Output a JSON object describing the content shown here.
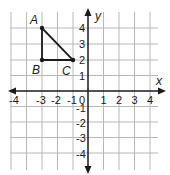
{
  "figure": {
    "type": "coordinate-plane",
    "x_axis_label": "x",
    "y_axis_label": "y",
    "x_ticks": [
      "-4",
      "-3",
      "-2",
      "-1",
      "0",
      "1",
      "2",
      "3",
      "4"
    ],
    "y_ticks": [
      "4",
      "3",
      "2",
      "1",
      "-1",
      "-2",
      "-3",
      "-4"
    ],
    "origin_label": "0",
    "range": {
      "x": [
        -5,
        5
      ],
      "y": [
        -5,
        5
      ]
    },
    "grid_color": "#b8b8b8",
    "axis_color": "#1a1a1a"
  },
  "triangle": {
    "points": [
      {
        "label": "A",
        "x": -3,
        "y": 4
      },
      {
        "label": "B",
        "x": -3,
        "y": 2
      },
      {
        "label": "C",
        "x": -1,
        "y": 2
      }
    ],
    "stroke": "#1a1a1a"
  },
  "labels": {
    "A": "A",
    "B": "B",
    "C": "C",
    "x": "x",
    "y": "y",
    "t_neg4": "-4",
    "t_neg3": "-3",
    "t_neg2": "-2",
    "t_neg1": "-1",
    "t_0": "0",
    "t_1": "1",
    "t_2": "2",
    "t_3": "3",
    "t_4": "4",
    "ty_4": "4",
    "ty_3": "3",
    "ty_2": "2",
    "ty_1": "1",
    "ty_neg1": "-1",
    "ty_neg2": "-2",
    "ty_neg3": "-3",
    "ty_neg4": "-4"
  }
}
